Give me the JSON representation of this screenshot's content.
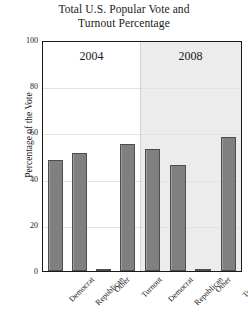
{
  "chart_data": {
    "type": "bar",
    "title": "Total U.S. Popular Vote and Turnout Percentage",
    "title_line1": "Total U.S. Popular Vote and",
    "title_line2": "Turnout Percentage",
    "xlabel": "",
    "ylabel": "Percentage of the Vote",
    "ylim": [
      0,
      100
    ],
    "yticks": [
      0,
      20,
      40,
      60,
      80,
      100
    ],
    "ytick_labels": [
      "0",
      "20",
      "40",
      "60",
      "80",
      "100"
    ],
    "grid": true,
    "legend": "none",
    "panels": [
      {
        "label": "2004",
        "background": "#ffffff",
        "categories": [
          "Democrat",
          "Republican",
          "Other",
          "Turnout"
        ],
        "values": [
          48,
          51,
          1,
          55
        ]
      },
      {
        "label": "2008",
        "background": "#ececec",
        "categories": [
          "Democrat",
          "Republican",
          "Other",
          "Turnout"
        ],
        "values": [
          53,
          46,
          1,
          58
        ]
      }
    ],
    "bar_color": "#808080",
    "bar_edge_color": "#4d4d4d",
    "axis_color": "#1a1a1a",
    "gridline_color": "#e2e2e2"
  }
}
